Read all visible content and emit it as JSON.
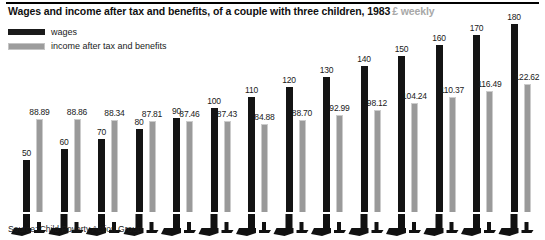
{
  "header": {
    "title_main": "Wages and income after tax and benefits, of a couple with three children, 1983",
    "title_units": "£ weekly"
  },
  "legend": {
    "position": "top-left",
    "items": [
      {
        "label": "wages",
        "color": "#141414",
        "key": "wages"
      },
      {
        "label": "income after tax and benefits",
        "color": "#9a9a9a",
        "key": "income"
      }
    ]
  },
  "footer": {
    "source": "Source: Child Poverty Action Group"
  },
  "chart_data": {
    "type": "bar",
    "title": "Wages and income after tax and benefits, of a couple with three children, 1983",
    "subtitle": "£ weekly",
    "xlabel": "",
    "ylabel": "£ weekly",
    "grid": false,
    "legend_position": "top-left",
    "ylim": [
      0,
      190
    ],
    "categories": [
      "50",
      "60",
      "70",
      "80",
      "90",
      "100",
      "110",
      "120",
      "130",
      "140",
      "150",
      "160",
      "170",
      "180"
    ],
    "series": [
      {
        "name": "wages",
        "color": "#141414",
        "values": [
          50,
          60,
          70,
          80,
          90,
          100,
          110,
          120,
          130,
          140,
          150,
          160,
          170,
          180
        ],
        "labels": [
          "50",
          "60",
          "70",
          "80",
          "90",
          "100",
          "110",
          "120",
          "130",
          "140",
          "150",
          "160",
          "170",
          "180"
        ]
      },
      {
        "name": "income after tax and benefits",
        "color": "#9a9a9a",
        "values": [
          88.89,
          88.86,
          88.34,
          87.81,
          87.46,
          87.43,
          84.88,
          88.7,
          92.99,
          98.12,
          104.24,
          110.37,
          116.49,
          122.62
        ],
        "labels": [
          "88.89",
          "88.86",
          "88.34",
          "87.81",
          "87.46",
          "87.43",
          "84.88",
          "88.70",
          "92.99",
          "98.12",
          "104.24",
          "110.37",
          "116.49",
          "122.62"
        ]
      }
    ]
  }
}
